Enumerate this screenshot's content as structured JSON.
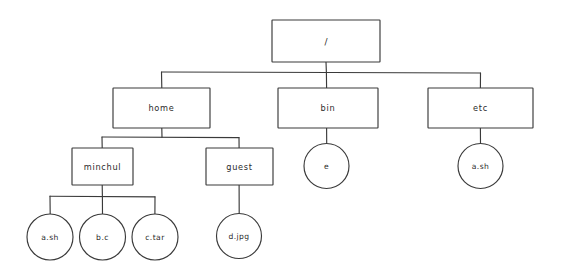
{
  "diagram": {
    "style": "hand-drawn",
    "stroke_color": "#3a3a3a",
    "background_color": "#ffffff",
    "text_color": "#2b2b2b",
    "nodes": {
      "root": {
        "label": "/",
        "shape": "rectangle"
      },
      "home": {
        "label": "home",
        "shape": "rectangle"
      },
      "bin": {
        "label": "bin",
        "shape": "rectangle"
      },
      "etc": {
        "label": "etc",
        "shape": "rectangle"
      },
      "minchul": {
        "label": "minchul",
        "shape": "rectangle"
      },
      "guest": {
        "label": "guest",
        "shape": "rectangle"
      },
      "a_sh_minchul": {
        "label": "a.sh",
        "shape": "circle"
      },
      "b_c": {
        "label": "b.c",
        "shape": "circle"
      },
      "c_tar": {
        "label": "c.tar",
        "shape": "circle"
      },
      "d_jpg": {
        "label": "d.jpg",
        "shape": "circle"
      },
      "e_bin": {
        "label": "e",
        "shape": "circle"
      },
      "a_sh_etc": {
        "label": "a.sh",
        "shape": "circle"
      }
    }
  }
}
